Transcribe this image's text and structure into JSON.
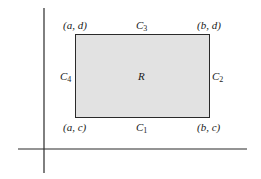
{
  "diagram": {
    "region_label": "R",
    "corners": {
      "top_left": "(a, d)",
      "top_right": "(b, d)",
      "bottom_left": "(a, c)",
      "bottom_right": "(b, c)"
    },
    "curves": {
      "bottom": {
        "letter": "C",
        "index": "1"
      },
      "right": {
        "letter": "C",
        "index": "2"
      },
      "top": {
        "letter": "C",
        "index": "3"
      },
      "left": {
        "letter": "C",
        "index": "4"
      }
    },
    "colors": {
      "region_fill": "#e2e2e2",
      "stroke": "#2a2a2a"
    }
  }
}
